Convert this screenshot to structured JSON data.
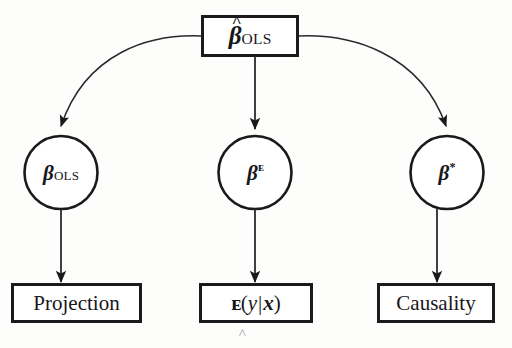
{
  "figure": {
    "type": "flow-diagram",
    "background_color": "#fdfdfc",
    "stroke_color": "#1a1a1c",
    "nodes": {
      "root_box": {
        "shape": "rectangle",
        "symbol": "beta-hat-OLS",
        "hat": "^",
        "base": "β",
        "subscript": "OLS"
      },
      "circle_left": {
        "shape": "circle",
        "symbol": "beta-OLS",
        "base": "β",
        "subscript": "OLS"
      },
      "circle_middle": {
        "shape": "circle",
        "symbol": "beta-E",
        "base": "β",
        "superscript": "ᴇ"
      },
      "circle_right": {
        "shape": "circle",
        "symbol": "beta-star",
        "base": "β",
        "superscript": "*"
      },
      "box_projection": {
        "shape": "rectangle",
        "label": "Projection"
      },
      "box_expectation": {
        "shape": "rectangle",
        "expectation_operator": "ᴇ",
        "open_paren": "(",
        "dependent": "y",
        "bar": "|",
        "regressors": "x",
        "close_paren": ")"
      },
      "box_causality": {
        "shape": "rectangle",
        "label": "Causality"
      }
    },
    "edges": [
      {
        "from": "root_box",
        "to": "circle_left",
        "style": "curved",
        "arrow": "end"
      },
      {
        "from": "root_box",
        "to": "circle_middle",
        "style": "straight",
        "arrow": "end"
      },
      {
        "from": "root_box",
        "to": "circle_right",
        "style": "curved",
        "arrow": "end"
      },
      {
        "from": "circle_left",
        "to": "box_projection",
        "style": "straight",
        "arrow": "end"
      },
      {
        "from": "circle_middle",
        "to": "box_expectation",
        "style": "straight",
        "arrow": "end"
      },
      {
        "from": "circle_right",
        "to": "box_causality",
        "style": "straight",
        "arrow": "end"
      }
    ],
    "artifact": "^"
  }
}
